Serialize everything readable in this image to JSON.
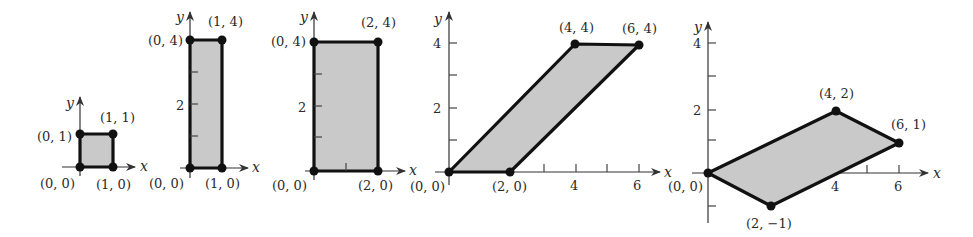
{
  "figures": [
    {
      "id": "unit-square",
      "axes": {
        "x_label": "x",
        "y_label": "y"
      },
      "vertices": [
        {
          "label": "(0, 0)",
          "x": 0,
          "y": 0
        },
        {
          "label": "(1, 0)",
          "x": 1,
          "y": 0
        },
        {
          "label": "(1, 1)",
          "x": 1,
          "y": 1
        },
        {
          "label": "(0, 1)",
          "x": 0,
          "y": 1
        }
      ],
      "ticks": {
        "x": [],
        "y": []
      }
    },
    {
      "id": "vertical-stretch-1x4",
      "axes": {
        "x_label": "x",
        "y_label": "y"
      },
      "vertices": [
        {
          "label": "(0, 0)",
          "x": 0,
          "y": 0
        },
        {
          "label": "(1, 0)",
          "x": 1,
          "y": 0
        },
        {
          "label": "(1, 4)",
          "x": 1,
          "y": 4
        },
        {
          "label": "(0, 4)",
          "x": 0,
          "y": 4
        }
      ],
      "ticks": {
        "x": [],
        "y": [
          "2"
        ]
      }
    },
    {
      "id": "rectangle-2x4",
      "axes": {
        "x_label": "x",
        "y_label": "y"
      },
      "vertices": [
        {
          "label": "(0, 0)",
          "x": 0,
          "y": 0
        },
        {
          "label": "(2, 0)",
          "x": 2,
          "y": 0
        },
        {
          "label": "(2, 4)",
          "x": 2,
          "y": 4
        },
        {
          "label": "(0, 4)",
          "x": 0,
          "y": 4
        }
      ],
      "ticks": {
        "x": [],
        "y": [
          "2"
        ]
      }
    },
    {
      "id": "shear-parallelogram",
      "axes": {
        "x_label": "x",
        "y_label": "y"
      },
      "vertices": [
        {
          "label": "(0, 0)",
          "x": 0,
          "y": 0
        },
        {
          "label": "(2, 0)",
          "x": 2,
          "y": 0
        },
        {
          "label": "(6, 4)",
          "x": 6,
          "y": 4
        },
        {
          "label": "(4, 4)",
          "x": 4,
          "y": 4
        }
      ],
      "ticks": {
        "x": [
          "4",
          "6"
        ],
        "y": [
          "2",
          "4"
        ]
      }
    },
    {
      "id": "rotated-parallelogram",
      "axes": {
        "x_label": "x",
        "y_label": "y"
      },
      "vertices": [
        {
          "label": "(0, 0)",
          "x": 0,
          "y": 0
        },
        {
          "label": "(2, −1)",
          "x": 2,
          "y": -1
        },
        {
          "label": "(6, 1)",
          "x": 6,
          "y": 1
        },
        {
          "label": "(4, 2)",
          "x": 4,
          "y": 2
        }
      ],
      "ticks": {
        "x": [
          "4",
          "6"
        ],
        "y": [
          "2",
          "4"
        ]
      }
    }
  ]
}
